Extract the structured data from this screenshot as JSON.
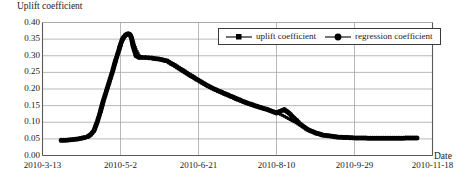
{
  "chart_data": {
    "type": "line",
    "title": "",
    "ylabel": "Uplift coefficient",
    "xlabel": "Date",
    "ylim": [
      0.0,
      0.4
    ],
    "ytick_labels": [
      "0.00",
      "0.05",
      "0.10",
      "0.15",
      "0.20",
      "0.25",
      "0.30",
      "0.35",
      "0.40"
    ],
    "ytick_values": [
      0.0,
      0.05,
      0.1,
      0.15,
      0.2,
      0.25,
      0.3,
      0.35,
      0.4
    ],
    "xtick_labels": [
      "2010-3-13",
      "2010-5-2",
      "2010-6-21",
      "2010-8-10",
      "2010-9-29",
      "2010-11-18"
    ],
    "xtick_values": [
      0,
      50,
      100,
      150,
      200,
      250
    ],
    "xlim": [
      0,
      250
    ],
    "grid": true,
    "legend_position": "top-right",
    "legend": [
      "uplift coefficient",
      "regression coefficient"
    ],
    "series": [
      {
        "name": "uplift coefficient",
        "marker": "square",
        "x": [
          12,
          15,
          18,
          21,
          24,
          27,
          29,
          31,
          33,
          34,
          35,
          36,
          37,
          38,
          39,
          40,
          41,
          42,
          43,
          44,
          45,
          46,
          47,
          48,
          49,
          50,
          51,
          52,
          53,
          54,
          55,
          56,
          57,
          58,
          60,
          62,
          64,
          66,
          68,
          70,
          73,
          76,
          80,
          85,
          90,
          95,
          100,
          105,
          110,
          115,
          120,
          125,
          130,
          135,
          140,
          145,
          150,
          155,
          160,
          165,
          170,
          175,
          180,
          190,
          200,
          210,
          220,
          230,
          240
        ],
        "y": [
          0.044,
          0.045,
          0.046,
          0.048,
          0.05,
          0.052,
          0.055,
          0.062,
          0.072,
          0.085,
          0.098,
          0.112,
          0.128,
          0.145,
          0.162,
          0.178,
          0.193,
          0.208,
          0.222,
          0.238,
          0.252,
          0.268,
          0.285,
          0.3,
          0.315,
          0.33,
          0.343,
          0.352,
          0.358,
          0.362,
          0.364,
          0.363,
          0.36,
          0.345,
          0.318,
          0.3,
          0.295,
          0.294,
          0.293,
          0.292,
          0.29,
          0.288,
          0.283,
          0.272,
          0.258,
          0.243,
          0.228,
          0.213,
          0.2,
          0.188,
          0.177,
          0.167,
          0.158,
          0.15,
          0.143,
          0.136,
          0.13,
          0.118,
          0.105,
          0.092,
          0.08,
          0.07,
          0.063,
          0.057,
          0.054,
          0.053,
          0.052,
          0.052,
          0.052
        ]
      },
      {
        "name": "regression coefficient",
        "marker": "circle",
        "x": [
          12,
          15,
          18,
          21,
          24,
          27,
          29,
          31,
          33,
          34,
          35,
          36,
          37,
          38,
          39,
          40,
          41,
          42,
          43,
          44,
          45,
          46,
          47,
          48,
          49,
          50,
          51,
          52,
          53,
          54,
          55,
          56,
          57,
          58,
          60,
          62,
          64,
          66,
          68,
          70,
          73,
          76,
          80,
          85,
          90,
          95,
          100,
          105,
          110,
          115,
          120,
          125,
          130,
          135,
          140,
          145,
          150,
          152,
          155,
          158,
          160,
          163,
          165,
          168,
          170,
          175,
          180,
          190,
          200,
          210,
          220,
          230,
          240
        ],
        "y": [
          0.046,
          0.046,
          0.047,
          0.049,
          0.051,
          0.054,
          0.057,
          0.064,
          0.075,
          0.088,
          0.1,
          0.115,
          0.13,
          0.148,
          0.165,
          0.18,
          0.195,
          0.21,
          0.225,
          0.24,
          0.255,
          0.272,
          0.288,
          0.303,
          0.318,
          0.334,
          0.347,
          0.356,
          0.362,
          0.365,
          0.366,
          0.364,
          0.355,
          0.33,
          0.3,
          0.295,
          0.295,
          0.295,
          0.294,
          0.293,
          0.291,
          0.289,
          0.284,
          0.27,
          0.255,
          0.24,
          0.226,
          0.212,
          0.2,
          0.19,
          0.18,
          0.17,
          0.16,
          0.152,
          0.144,
          0.137,
          0.128,
          0.132,
          0.138,
          0.128,
          0.118,
          0.105,
          0.095,
          0.085,
          0.078,
          0.068,
          0.061,
          0.055,
          0.053,
          0.052,
          0.052,
          0.052,
          0.053
        ]
      }
    ]
  },
  "colors": {
    "series_line": "#000000",
    "grid": "#a6a6a6",
    "axis": "#595959",
    "background": "#ffffff"
  }
}
